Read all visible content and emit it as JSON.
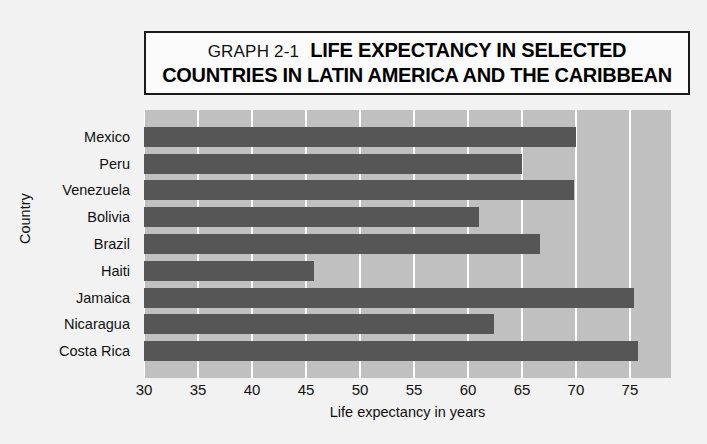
{
  "title": {
    "graph_number": "GRAPH 2-1",
    "line1": "LIFE EXPECTANCY IN SELECTED",
    "line2": "COUNTRIES IN LATIN AMERICA AND THE CARIBBEAN"
  },
  "axes": {
    "x_title": "Life expectancy in years",
    "y_title": "Country"
  },
  "colors": {
    "bar": "#565656",
    "plot_background": "#c0c0c0",
    "gridline": "#fdfdfd",
    "page_background": "#f2f2f2",
    "title_border": "#1a1a1a",
    "text": "#111111"
  },
  "chart_data": {
    "type": "bar",
    "orientation": "horizontal",
    "title": "GRAPH 2-1 LIFE EXPECTANCY IN SELECTED COUNTRIES IN LATIN AMERICA AND THE CARIBBEAN",
    "xlabel": "Life expectancy in years",
    "ylabel": "Country",
    "categories": [
      "Mexico",
      "Peru",
      "Venezuela",
      "Bolivia",
      "Brazil",
      "Haiti",
      "Jamaica",
      "Nicaragua",
      "Costa Rica"
    ],
    "values": [
      70.0,
      65.0,
      69.8,
      61.0,
      66.7,
      45.7,
      75.4,
      62.4,
      75.7
    ],
    "xlim": [
      30,
      78.8
    ],
    "xticks": [
      30,
      35,
      40,
      45,
      50,
      55,
      60,
      65,
      70,
      75
    ],
    "xtick_labels": [
      "30",
      "35",
      "40",
      "45",
      "50",
      "55",
      "60",
      "65",
      "70",
      "75"
    ],
    "grid": "vertical",
    "legend": "none"
  }
}
